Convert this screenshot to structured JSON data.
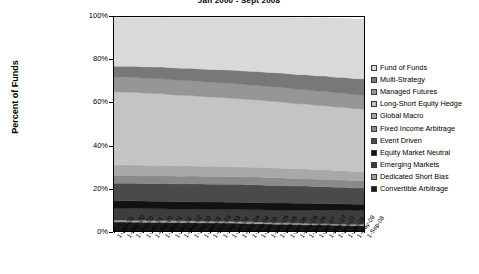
{
  "chart_data": {
    "type": "area",
    "title": "Jan 2000 - Sept 2008",
    "xlabel": "",
    "ylabel": "Percent of Funds",
    "ylim": [
      0,
      100
    ],
    "ytick_labels": [
      "100%",
      "80%",
      "60%",
      "40%",
      "20%",
      "0%"
    ],
    "ytick_values": [
      100,
      80,
      60,
      40,
      20,
      0
    ],
    "grid": false,
    "legend_position": "right",
    "stacked": true,
    "stack_order_bottom_to_top": [
      "Convertible Arbitrage",
      "Dedicated Short Bias",
      "Emerging Markets",
      "Equity Market Neutral",
      "Event Driven",
      "Fixed Income Arbitrage",
      "Global Macro",
      "Long-Short Equity Hedge",
      "Managed Futures",
      "Multi-Strategy",
      "Fund of Funds"
    ],
    "x": [
      "1-Jan-00",
      "1-May-00",
      "1-Sep-00",
      "1-Jan-01",
      "1-May-01",
      "1-Sep-01",
      "1-Jan-02",
      "1-May-02",
      "1-Sep-02",
      "1-Jan-03",
      "1-May-03",
      "1-Sep-03",
      "1-Jan-04",
      "1-May-04",
      "1-Sep-04",
      "1-Jan-05",
      "1-May-05",
      "1-Sep-05",
      "1-Jan-06",
      "1-May-06",
      "1-Sep-06",
      "1-Jan-07",
      "1-May-07",
      "1-Sep-07",
      "1-Jan-08",
      "1-May-08",
      "1-Sep-08"
    ],
    "series": [
      {
        "name": "Convertible Arbitrage",
        "color": "#1a1a1a",
        "values": [
          4.2,
          4.2,
          4.1,
          4.1,
          4.0,
          4.0,
          4.0,
          3.9,
          3.9,
          3.8,
          3.8,
          3.7,
          3.7,
          3.6,
          3.5,
          3.4,
          3.3,
          3.2,
          3.1,
          3.0,
          2.9,
          2.8,
          2.8,
          2.7,
          2.6,
          2.5,
          2.5
        ]
      },
      {
        "name": "Dedicated Short Bias",
        "color": "#9e9e9e",
        "values": [
          0.9,
          0.9,
          0.9,
          0.9,
          0.9,
          0.9,
          0.9,
          0.9,
          0.9,
          0.9,
          0.8,
          0.8,
          0.8,
          0.8,
          0.8,
          0.8,
          0.7,
          0.7,
          0.7,
          0.7,
          0.7,
          0.6,
          0.6,
          0.6,
          0.6,
          0.6,
          0.6
        ]
      },
      {
        "name": "Emerging Markets",
        "color": "#3d3d3d",
        "values": [
          5.6,
          5.6,
          5.6,
          5.5,
          5.5,
          5.5,
          5.4,
          5.4,
          5.4,
          5.4,
          5.4,
          5.5,
          5.5,
          5.6,
          5.6,
          5.7,
          5.8,
          5.9,
          6.0,
          6.1,
          6.2,
          6.3,
          6.4,
          6.4,
          6.5,
          6.5,
          6.5
        ]
      },
      {
        "name": "Equity Market Neutral",
        "color": "#121212",
        "values": [
          3.5,
          3.5,
          3.5,
          3.5,
          3.5,
          3.5,
          3.5,
          3.5,
          3.5,
          3.5,
          3.5,
          3.5,
          3.4,
          3.4,
          3.4,
          3.4,
          3.3,
          3.3,
          3.3,
          3.2,
          3.2,
          3.1,
          3.1,
          3.0,
          3.0,
          2.9,
          2.9
        ]
      },
      {
        "name": "Event Driven",
        "color": "#4a4a4a",
        "values": [
          8.1,
          8.1,
          8.2,
          8.2,
          8.2,
          8.3,
          8.3,
          8.3,
          8.4,
          8.4,
          8.4,
          8.4,
          8.4,
          8.4,
          8.3,
          8.3,
          8.2,
          8.2,
          8.1,
          8.0,
          8.0,
          7.9,
          7.8,
          7.8,
          7.7,
          7.6,
          7.6
        ]
      },
      {
        "name": "Fixed Income Arbitrage",
        "color": "#8a8a8a",
        "values": [
          3.6,
          3.6,
          3.6,
          3.6,
          3.6,
          3.6,
          3.6,
          3.6,
          3.6,
          3.6,
          3.6,
          3.6,
          3.6,
          3.6,
          3.6,
          3.6,
          3.6,
          3.6,
          3.5,
          3.5,
          3.5,
          3.5,
          3.5,
          3.4,
          3.4,
          3.4,
          3.4
        ]
      },
      {
        "name": "Global Macro",
        "color": "#a8a8a8",
        "values": [
          5.0,
          5.0,
          5.0,
          4.9,
          4.9,
          4.9,
          4.8,
          4.8,
          4.8,
          4.7,
          4.7,
          4.7,
          4.7,
          4.6,
          4.6,
          4.6,
          4.6,
          4.5,
          4.5,
          4.5,
          4.5,
          4.4,
          4.4,
          4.4,
          4.4,
          4.3,
          4.3
        ]
      },
      {
        "name": "Long-Short Equity Hedge",
        "color": "#c4c4c4",
        "values": [
          34.1,
          34.0,
          33.9,
          33.8,
          33.6,
          33.4,
          33.2,
          33.0,
          32.8,
          32.6,
          32.4,
          32.2,
          32.0,
          31.8,
          31.6,
          31.4,
          31.2,
          31.0,
          30.8,
          30.5,
          30.3,
          30.1,
          29.9,
          29.7,
          29.5,
          29.3,
          29.2
        ]
      },
      {
        "name": "Managed Futures",
        "color": "#969696",
        "values": [
          7.0,
          7.0,
          7.0,
          7.0,
          7.0,
          7.0,
          7.0,
          6.9,
          6.9,
          6.9,
          6.9,
          6.9,
          6.9,
          6.9,
          6.8,
          6.8,
          6.8,
          6.8,
          6.8,
          6.7,
          6.7,
          6.7,
          6.7,
          6.6,
          6.6,
          6.6,
          6.6
        ]
      },
      {
        "name": "Multi-Strategy",
        "color": "#787878",
        "values": [
          5.0,
          5.1,
          5.2,
          5.3,
          5.4,
          5.5,
          5.6,
          5.7,
          5.8,
          5.9,
          6.0,
          6.1,
          6.2,
          6.3,
          6.4,
          6.5,
          6.6,
          6.7,
          6.8,
          6.9,
          7.0,
          7.1,
          7.2,
          7.3,
          7.4,
          7.5,
          7.5
        ]
      },
      {
        "name": "Fund of Funds",
        "color": "#d9d9d9",
        "values": [
          22.7,
          22.8,
          22.8,
          22.9,
          23.1,
          23.2,
          23.4,
          23.7,
          23.8,
          24.0,
          24.2,
          24.4,
          24.6,
          24.8,
          25.1,
          25.3,
          25.6,
          25.8,
          26.1,
          26.4,
          26.7,
          27.0,
          27.2,
          27.5,
          27.7,
          27.9,
          28.0
        ]
      }
    ]
  },
  "legend": {
    "items": [
      {
        "label": "Fund of Funds",
        "color": "#d9d9d9"
      },
      {
        "label": "Multi-Strategy",
        "color": "#787878"
      },
      {
        "label": "Managed Futures",
        "color": "#969696"
      },
      {
        "label": "Long-Short Equity Hedge",
        "color": "#c4c4c4"
      },
      {
        "label": "Global Macro",
        "color": "#a8a8a8"
      },
      {
        "label": "Fixed Income Arbitrage",
        "color": "#8a8a8a"
      },
      {
        "label": "Event Driven",
        "color": "#4a4a4a"
      },
      {
        "label": "Equity Market Neutral",
        "color": "#121212"
      },
      {
        "label": "Emerging Markets",
        "color": "#3d3d3d"
      },
      {
        "label": "Dedicated Short Bias",
        "color": "#9e9e9e"
      },
      {
        "label": "Convertible Arbitrage",
        "color": "#1a1a1a"
      }
    ]
  }
}
